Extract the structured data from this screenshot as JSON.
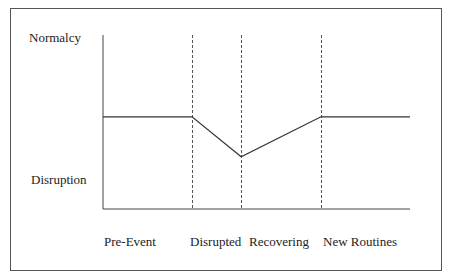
{
  "chart_data": {
    "type": "line",
    "title": "",
    "ylabel_top": "Normalcy",
    "ylabel_bottom": "Disruption",
    "phases": [
      "Pre-Event",
      "Disrupted",
      "Recovering",
      "New Routines"
    ],
    "ylim": [
      0,
      1
    ],
    "series": [
      {
        "name": "Normalcy level",
        "points": [
          {
            "x": 0,
            "y": 0.53
          },
          {
            "x": 0.29,
            "y": 0.53
          },
          {
            "x": 0.45,
            "y": 0.3
          },
          {
            "x": 0.71,
            "y": 0.53
          },
          {
            "x": 1.0,
            "y": 0.53
          }
        ]
      }
    ],
    "phase_boundaries": [
      0.29,
      0.45,
      0.71
    ],
    "grid": false
  }
}
